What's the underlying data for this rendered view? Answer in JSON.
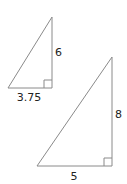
{
  "diagram": {
    "small_triangle": {
      "height_label": "6",
      "base_label": "3.75",
      "right_angle": true
    },
    "large_triangle": {
      "height_label": "8",
      "base_label": "5",
      "right_angle": true
    },
    "colors": {
      "line": "#9a9a9a",
      "text": "#222222",
      "background": "#ffffff"
    }
  }
}
